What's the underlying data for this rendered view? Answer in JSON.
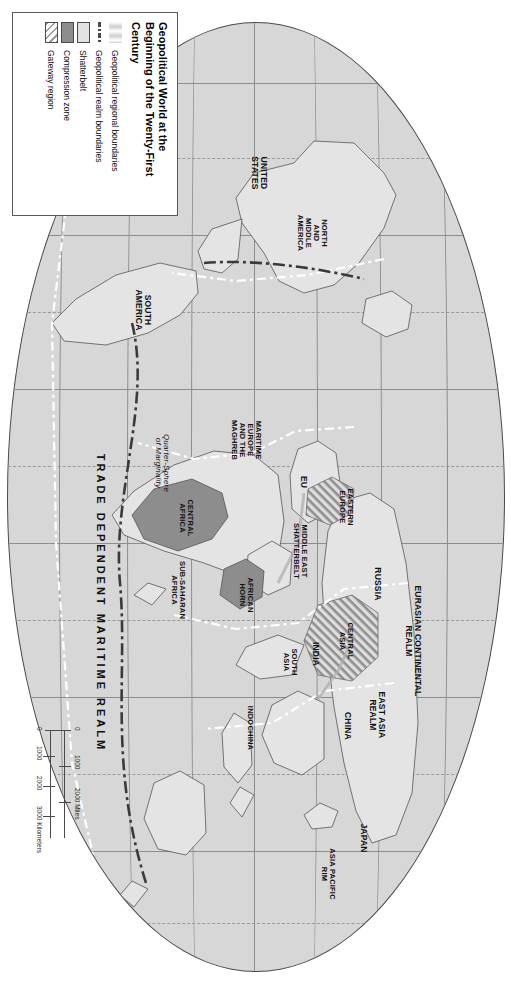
{
  "map": {
    "projection_shape": "oval",
    "legend": {
      "title": "Geopolitical World at the Beginning of the Twenty-First Century",
      "items": [
        {
          "swatch": "regional-boundary-band",
          "label": "Geopolitical regional boundaries"
        },
        {
          "swatch": "realm-boundary-dashdot",
          "label": "Geopolitical realm boundaries"
        },
        {
          "swatch": "shatterbelt-fill",
          "label": "Shatterbelt"
        },
        {
          "swatch": "compression-zone-fill",
          "label": "Compression zone"
        },
        {
          "swatch": "gateway-region-hatch",
          "label": "Gateway region"
        }
      ]
    },
    "scale": {
      "miles_unit": "2000 Miles",
      "kilometers_unit": "3000 Kilometers",
      "miles_ticks": [
        "0",
        "1000",
        "2000"
      ],
      "km_ticks": [
        "0",
        "1000",
        "2000",
        "3000"
      ]
    },
    "realm_labels": [
      {
        "id": "eurasian-continental-realm",
        "text": "EURASIAN CONTINENTAL\nREALM"
      },
      {
        "id": "east-asia-realm",
        "text": "EAST ASIA\nREALM"
      },
      {
        "id": "trade-dependent-maritime-realm",
        "text": "TRADE DEPENDENT MARITIME REALM"
      }
    ],
    "region_labels": [
      {
        "id": "united-states",
        "text": "UNITED\nSTATES"
      },
      {
        "id": "north-middle-america",
        "text": "NORTH\nAND\nMIDDLE\nAMERICA"
      },
      {
        "id": "south-america",
        "text": "SOUTH\nAMERICA"
      },
      {
        "id": "maritime-europe-maghreb",
        "text": "MARITIME\nEUROPE\nAND THE\nMAGHREB"
      },
      {
        "id": "eu",
        "text": "EU"
      },
      {
        "id": "eastern-europe",
        "text": "EASTERN\nEUROPE"
      },
      {
        "id": "russia",
        "text": "RUSSIA"
      },
      {
        "id": "central-asia",
        "text": "CENTRAL\nASIA"
      },
      {
        "id": "middle-east-shatterbelt",
        "text": "MIDDLE EAST\nSHATTERBELT"
      },
      {
        "id": "african-horn",
        "text": "AFRICAN\nHORN"
      },
      {
        "id": "central-africa",
        "text": "CENTRAL\nAFRICA"
      },
      {
        "id": "sub-saharan-africa",
        "text": "SUB-SAHARAN\nAFRICA"
      },
      {
        "id": "india-south-asia-india",
        "text": "INDIA"
      },
      {
        "id": "south-asia",
        "text": "SOUTH\nASIA"
      },
      {
        "id": "indochina",
        "text": "INDOCHINA"
      },
      {
        "id": "china",
        "text": "CHINA"
      },
      {
        "id": "japan",
        "text": "JAPAN"
      },
      {
        "id": "asia-pacific-rim",
        "text": "ASIA PACIFIC\nRIM"
      }
    ],
    "annotations": [
      {
        "id": "quarter-sphere-of-marginality",
        "text": "Quarter-Sphere\nof Marginality"
      }
    ],
    "colors": {
      "ocean": "#d7d7d7",
      "land": "#e4e4e4",
      "compression_zone": "#8d8d8d",
      "shatterbelt": "#e2e2e2",
      "graticule": "#8d8d8d",
      "outline": "#4a4a4a"
    }
  }
}
